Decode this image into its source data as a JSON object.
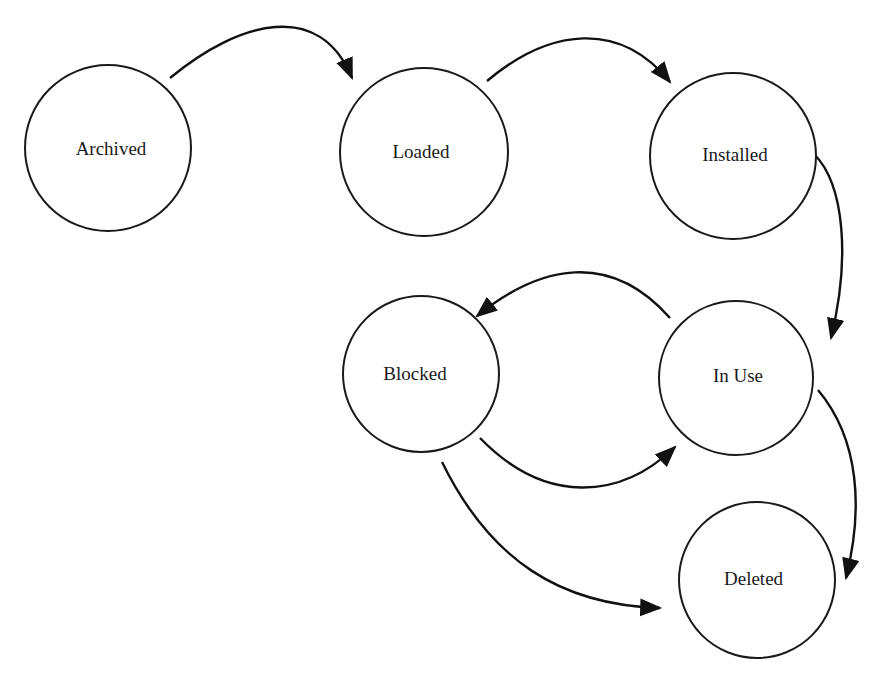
{
  "diagram": {
    "type": "state-transition",
    "nodes": [
      {
        "id": "archived",
        "label": "Archived",
        "cx": 108,
        "cy": 148,
        "r": 83
      },
      {
        "id": "loaded",
        "label": "Loaded",
        "cx": 424,
        "cy": 152,
        "r": 84
      },
      {
        "id": "installed",
        "label": "Installed",
        "cx": 733,
        "cy": 156,
        "r": 83
      },
      {
        "id": "blocked",
        "label": "Blocked",
        "cx": 421,
        "cy": 374,
        "r": 78
      },
      {
        "id": "in_use",
        "label": "In Use",
        "cx": 736,
        "cy": 378,
        "r": 77
      },
      {
        "id": "deleted",
        "label": "Deleted",
        "cx": 757,
        "cy": 580,
        "r": 78
      }
    ],
    "edges": [
      {
        "from": "archived",
        "to": "loaded"
      },
      {
        "from": "loaded",
        "to": "installed"
      },
      {
        "from": "installed",
        "to": "in_use"
      },
      {
        "from": "in_use",
        "to": "blocked"
      },
      {
        "from": "blocked",
        "to": "in_use"
      },
      {
        "from": "blocked",
        "to": "deleted"
      },
      {
        "from": "in_use",
        "to": "deleted"
      }
    ]
  }
}
